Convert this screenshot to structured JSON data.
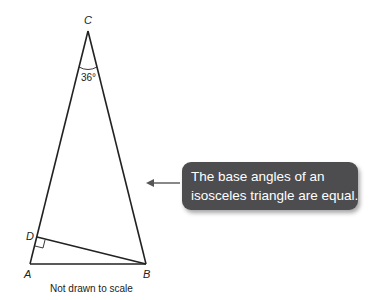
{
  "diagram": {
    "vertices": {
      "A": {
        "label": "A"
      },
      "B": {
        "label": "B"
      },
      "C": {
        "label": "C"
      },
      "D": {
        "label": "D"
      }
    },
    "angle_C": "36°",
    "right_angle_at": "D",
    "note": "Not drawn to scale"
  },
  "callout": {
    "line1": "The base angles of an",
    "line2": "isosceles triangle are equal."
  },
  "colors": {
    "callout_bg": "#4d4d4f",
    "line": "#222222"
  }
}
